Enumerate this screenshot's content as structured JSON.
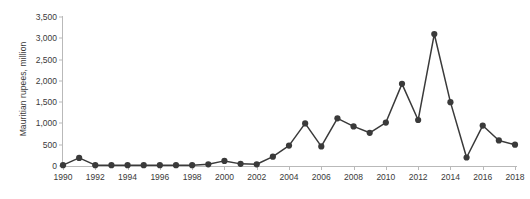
{
  "chart_data": {
    "type": "line",
    "title": "",
    "subtitle": "",
    "xlabel": "",
    "ylabel": "Mauritian rupees, million",
    "xlim": [
      1990,
      2018
    ],
    "ylim": [
      0,
      3500
    ],
    "grid": false,
    "legend": null,
    "marker": "filled-circle",
    "series_color": "#3a3a3a",
    "axis_color": "#b9b9b9",
    "y_ticks": [
      0,
      500,
      1000,
      1500,
      2000,
      2500,
      3000,
      3500
    ],
    "y_tick_labels": [
      "0",
      "500",
      "1,000",
      "1,500",
      "2,000",
      "2,500",
      "3,000",
      "3,500"
    ],
    "x_ticks": [
      1990,
      1992,
      1994,
      1996,
      1998,
      2000,
      2002,
      2004,
      2006,
      2008,
      2010,
      2012,
      2014,
      2016,
      2018
    ],
    "x_tick_labels": [
      "1990",
      "1992",
      "1994",
      "1996",
      "1998",
      "2000",
      "2002",
      "2004",
      "2006",
      "2008",
      "2010",
      "2012",
      "2014",
      "2016",
      "2018"
    ],
    "x": [
      1990,
      1991,
      1992,
      1993,
      1994,
      1995,
      1996,
      1997,
      1998,
      1999,
      2000,
      2001,
      2002,
      2003,
      2004,
      2005,
      2006,
      2007,
      2008,
      2009,
      2010,
      2011,
      2012,
      2013,
      2014,
      2015,
      2016,
      2017,
      2018
    ],
    "values": [
      20,
      190,
      20,
      20,
      20,
      20,
      20,
      20,
      20,
      40,
      120,
      50,
      40,
      220,
      480,
      1000,
      460,
      1120,
      930,
      780,
      1020,
      1930,
      1080,
      3100,
      1500,
      200,
      950,
      600,
      500
    ],
    "series": [
      {
        "name": "Mauritian rupees, million",
        "values": [
          20,
          190,
          20,
          20,
          20,
          20,
          20,
          20,
          20,
          40,
          120,
          50,
          40,
          220,
          480,
          1000,
          460,
          1120,
          930,
          780,
          1020,
          1930,
          1080,
          3100,
          1500,
          200,
          950,
          600,
          500
        ]
      }
    ]
  }
}
